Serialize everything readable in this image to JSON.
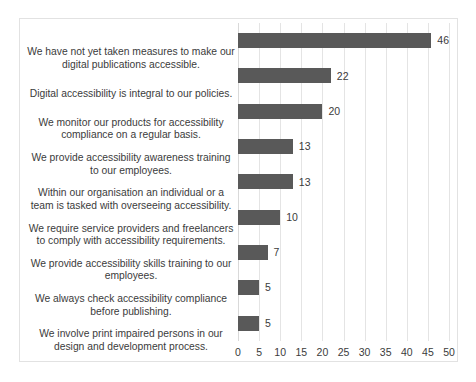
{
  "chart_data": {
    "type": "bar",
    "orientation": "horizontal",
    "title": "",
    "xlabel": "",
    "ylabel": "",
    "xlim": [
      0,
      50
    ],
    "xticks": [
      0,
      5,
      10,
      15,
      20,
      25,
      30,
      35,
      40,
      45,
      50
    ],
    "grid": true,
    "legend": "none",
    "bar_color": "#595959",
    "gridline_color": "#e4e4e4",
    "frame_color": "#e2e2e2",
    "text_color": "#3b3b3b",
    "categories": [
      "We have not yet taken measures to make our digital publications accessible.",
      "Digital accessibility is integral to our policies.",
      "We monitor our products for accessibility compliance on a regular basis.",
      "We provide accessibility awareness training to our employees.",
      "Within our organisation an individual or a team is tasked with overseeing accessibility.",
      "We require service providers and freelancers to comply with accessibility requirements.",
      "We provide accessibility skills training to our employees.",
      "We always check accessibility compliance before publishing.",
      "We involve print impaired persons in our design and development process."
    ],
    "values": [
      46,
      22,
      20,
      13,
      13,
      10,
      7,
      5,
      5
    ],
    "data_labels": [
      "46",
      "22",
      "20",
      "13",
      "13",
      "10",
      "7",
      "5",
      "5"
    ]
  },
  "caption": {
    "text": ""
  }
}
